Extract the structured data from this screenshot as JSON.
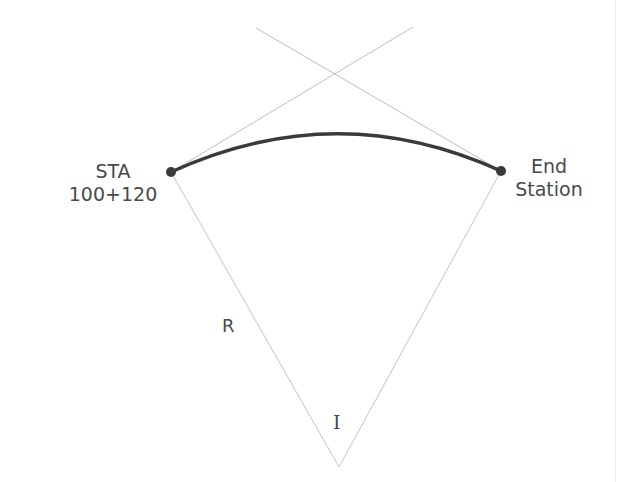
{
  "diagram": {
    "labels": {
      "start_line1": "STA",
      "start_line2": "100+120",
      "end_line1": "End",
      "end_line2": "Station",
      "radius": "R",
      "angle": "I"
    },
    "colors": {
      "curve": "#3a3a3a",
      "construction_lines": "#bdbdbd",
      "text": "#4a4a4a"
    },
    "points": {
      "PC": [
        171,
        172
      ],
      "PT": [
        501,
        171
      ],
      "PI": [
        337,
        77
      ],
      "center": [
        339,
        467
      ],
      "tangent_left_start": [
        256,
        28
      ],
      "tangent_right_start": [
        413,
        27
      ],
      "curve_apex": [
        337,
        134
      ]
    }
  }
}
